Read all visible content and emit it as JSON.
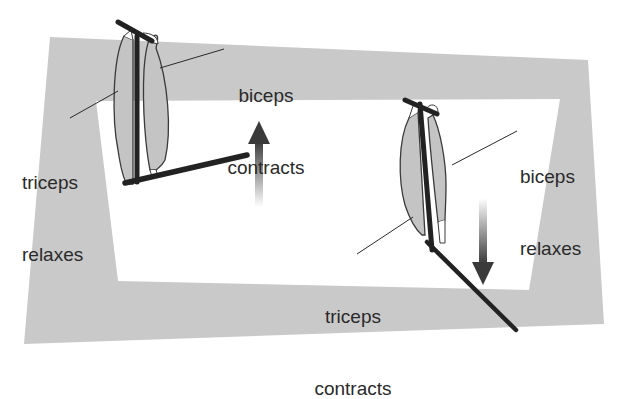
{
  "colors": {
    "frame": "#c9c9c9",
    "muscle_fill": "#c4c4c4",
    "muscle_stroke": "#3a3a3a",
    "bone": "#222222",
    "text": "#2a2a2a",
    "arrow_dark": "#3a3a3a",
    "background": "#ffffff"
  },
  "left_arm": {
    "state": "flexing",
    "labels": {
      "biceps": {
        "line1": "biceps",
        "line2": "contracts"
      },
      "triceps": {
        "line1": "triceps",
        "line2": "relaxes"
      }
    },
    "arrow": {
      "direction": "up",
      "icon": "arrow-up-icon"
    }
  },
  "right_arm": {
    "state": "extending",
    "labels": {
      "biceps": {
        "line1": "biceps",
        "line2": "relaxes"
      },
      "triceps": {
        "line1": "triceps",
        "line2": "contracts"
      }
    },
    "arrow": {
      "direction": "down",
      "icon": "arrow-down-icon"
    }
  }
}
